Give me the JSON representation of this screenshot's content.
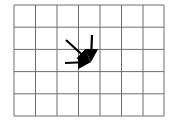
{
  "diagram": {
    "type": "grid-with-converging-arrows",
    "grid": {
      "columns": 7,
      "rows": 5,
      "x_lines": [
        14,
        35.5,
        57,
        78.5,
        100,
        121.5,
        143,
        164
      ],
      "y_lines": [
        5,
        27.2,
        49.4,
        71.6,
        93.8,
        116
      ],
      "line_color": "#6e6e6e"
    },
    "arrows": [
      {
        "name": "diagonal-arrow",
        "from": [
          66,
          40
        ],
        "to": [
          89,
          61
        ]
      },
      {
        "name": "vertical-arrow",
        "from": [
          92,
          35
        ],
        "to": [
          91,
          60
        ]
      },
      {
        "name": "horizontal-arrow",
        "from": [
          65,
          63
        ],
        "to": [
          89,
          62
        ]
      }
    ],
    "convergence_point": [
      90,
      62
    ],
    "arrow_color": "#000000"
  }
}
